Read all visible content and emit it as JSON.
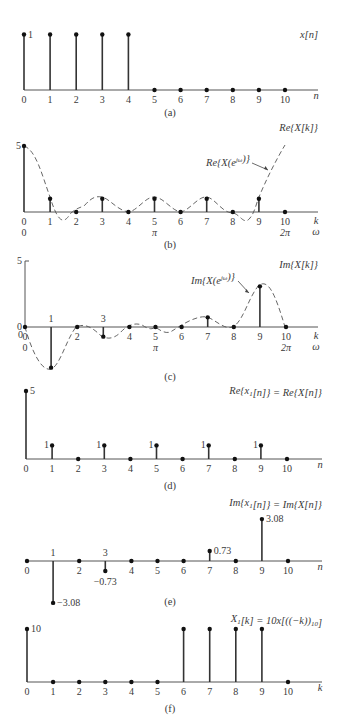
{
  "chart_data": [
    {
      "panel": "a",
      "type": "stem",
      "title": "x[n]",
      "caption": "(a)",
      "xlabel": "n",
      "x": [
        0,
        1,
        2,
        3,
        4,
        5,
        6,
        7,
        8,
        9,
        10
      ],
      "values": [
        1,
        1,
        1,
        1,
        1,
        0,
        0,
        0,
        0,
        0,
        0
      ],
      "value_labels": [
        {
          "k": 0,
          "text": "1"
        }
      ],
      "layout": {
        "x0": 24,
        "dx": 26.1,
        "base": 90,
        "scale": 55.5,
        "axis_end": 318,
        "title_x": 318,
        "title_y": 42,
        "xlabel_x": 316,
        "cap_y": 116
      }
    },
    {
      "panel": "b",
      "type": "stem",
      "title": "Re{X[k]}",
      "curve_label": "Re{X(e^jω)}",
      "caption": "(b)",
      "xlabel": "k",
      "xlabel2": "ω",
      "x": [
        0,
        1,
        2,
        3,
        4,
        5,
        6,
        7,
        8,
        9,
        10
      ],
      "values": [
        5,
        1,
        0,
        1,
        0,
        1,
        0,
        1,
        0,
        1,
        0
      ],
      "omega_ticks": [
        {
          "k": 0,
          "text": "0"
        },
        {
          "k": 5,
          "text": "π"
        },
        {
          "k": 10,
          "text": "2π"
        }
      ],
      "yticks": [
        {
          "v": 5,
          "text": "5"
        }
      ],
      "layout": {
        "x0": 24,
        "dx": 26.1,
        "base": 212,
        "scale": 13.2,
        "axis_end": 318,
        "cap_y": 248
      }
    },
    {
      "panel": "c",
      "type": "stem",
      "title": "Im{X[k]}",
      "curve_label": "Im{X(e^jω)}",
      "caption": "(c)",
      "xlabel": "k",
      "xlabel2": "ω",
      "x": [
        0,
        1,
        2,
        3,
        4,
        5,
        6,
        7,
        8,
        9,
        10
      ],
      "values": [
        0,
        -3.08,
        0,
        -0.73,
        0,
        0,
        0,
        0.73,
        0,
        3.08,
        0
      ],
      "omega_ticks": [
        {
          "k": 0,
          "text": "0"
        },
        {
          "k": 5,
          "text": "π"
        },
        {
          "k": 10,
          "text": "2π"
        }
      ],
      "yticks": [
        {
          "v": 5,
          "text": "5"
        },
        {
          "v": 0,
          "text": "0"
        }
      ],
      "layout": {
        "x0": 25,
        "dx": 26.1,
        "base": 327,
        "scale": 13.2,
        "axis_end": 318,
        "cap_y": 380
      }
    },
    {
      "panel": "d",
      "type": "stem",
      "title": "Re{x1[n]} = Re{X[n]}",
      "caption": "(d)",
      "xlabel": "n",
      "x": [
        0,
        1,
        2,
        3,
        4,
        5,
        6,
        7,
        8,
        9,
        10
      ],
      "values": [
        5,
        1,
        0,
        1,
        0,
        1,
        0,
        1,
        0,
        1,
        0
      ],
      "value_labels": [
        {
          "k": 0,
          "text": "5"
        },
        {
          "k": 1,
          "text": "1"
        },
        {
          "k": 3,
          "text": "1"
        },
        {
          "k": 5,
          "text": "1"
        },
        {
          "k": 7,
          "text": "1"
        },
        {
          "k": 9,
          "text": "1"
        }
      ],
      "layout": {
        "x0": 26,
        "dx": 26.1,
        "base": 459,
        "scale": 13.6,
        "axis_end": 322,
        "cap_y": 489
      }
    },
    {
      "panel": "e",
      "type": "stem",
      "title": "Im{x1[n]} = Im{X[n]}",
      "caption": "(e)",
      "xlabel": "n",
      "x": [
        0,
        1,
        2,
        3,
        4,
        5,
        6,
        7,
        8,
        9,
        10
      ],
      "values": [
        0,
        -3.08,
        0,
        -0.73,
        0,
        0,
        0,
        0.73,
        0,
        3.08,
        0
      ],
      "value_labels": [
        {
          "k": 1,
          "text": "−3.08"
        },
        {
          "k": 3,
          "text": "−0.73"
        },
        {
          "k": 7,
          "text": "0.73"
        },
        {
          "k": 9,
          "text": "3.08"
        }
      ],
      "layout": {
        "x0": 27,
        "dx": 26.1,
        "base": 561,
        "scale": 13.6,
        "axis_end": 322,
        "cap_y": 605
      }
    },
    {
      "panel": "f",
      "type": "stem",
      "title": "X1[k] = 10x[((−k))10]",
      "caption": "(f)",
      "xlabel": "k",
      "x": [
        0,
        1,
        2,
        3,
        4,
        5,
        6,
        7,
        8,
        9,
        10
      ],
      "values": [
        10,
        0,
        0,
        0,
        0,
        0,
        10,
        10,
        10,
        10,
        0
      ],
      "value_labels": [
        {
          "k": 0,
          "text": "10"
        }
      ],
      "layout": {
        "x0": 27,
        "dx": 26.1,
        "base": 682,
        "scale": 5.3,
        "axis_end": 322,
        "cap_y": 712
      }
    }
  ]
}
